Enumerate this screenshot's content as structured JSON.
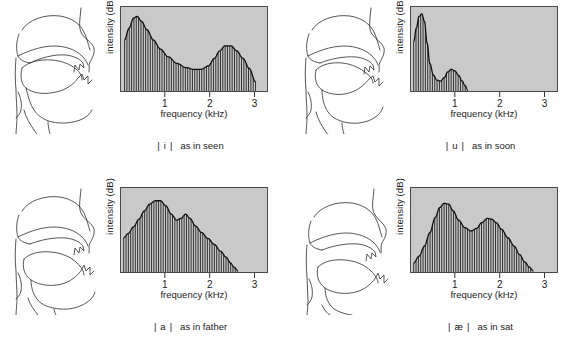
{
  "figure": {
    "plot_bg_color": "#c9c9c9",
    "line_color": "#1a1a1a"
  },
  "axes": {
    "ylabel": "intensity (dB)",
    "xlabel": "frequency (kHz)",
    "xticks": [
      "1",
      "2",
      "3"
    ]
  },
  "chart_data": [
    {
      "type": "line",
      "title": "| i |  as in seen",
      "xlabel": "frequency (kHz)",
      "ylabel": "intensity (dB)",
      "xlim": [
        0,
        3.3
      ],
      "ylim": [
        0,
        1
      ],
      "xticks": [
        1,
        2,
        3
      ],
      "grid": false,
      "legend": null,
      "harmonics": true,
      "envelope": {
        "x": [
          0.08,
          0.18,
          0.28,
          0.36,
          0.46,
          0.58,
          0.72,
          0.88,
          1.05,
          1.25,
          1.45,
          1.62,
          1.78,
          1.95,
          2.08,
          2.2,
          2.32,
          2.45,
          2.58,
          2.72,
          2.86,
          3.0
        ],
        "y": [
          0.62,
          0.76,
          0.88,
          0.9,
          0.84,
          0.74,
          0.62,
          0.51,
          0.42,
          0.34,
          0.29,
          0.27,
          0.27,
          0.31,
          0.4,
          0.49,
          0.55,
          0.55,
          0.49,
          0.4,
          0.28,
          0.12
        ]
      }
    },
    {
      "type": "line",
      "title": "| u |  as in soon",
      "xlabel": "frequency (kHz)",
      "ylabel": "intensity (dB)",
      "xlim": [
        0,
        3.3
      ],
      "ylim": [
        0,
        1
      ],
      "xticks": [
        1,
        2,
        3
      ],
      "grid": false,
      "legend": null,
      "harmonics": true,
      "envelope": {
        "x": [
          0.06,
          0.12,
          0.18,
          0.24,
          0.3,
          0.36,
          0.42,
          0.5,
          0.58,
          0.66,
          0.74,
          0.82,
          0.9,
          0.98,
          1.06,
          1.14,
          1.2,
          1.26
        ],
        "y": [
          0.6,
          0.76,
          0.9,
          0.93,
          0.84,
          0.58,
          0.34,
          0.2,
          0.14,
          0.13,
          0.17,
          0.24,
          0.27,
          0.25,
          0.2,
          0.13,
          0.08,
          0.03
        ]
      }
    },
    {
      "type": "line",
      "title": "| a |  as in father",
      "xlabel": "frequency (kHz)",
      "ylabel": "intensity (dB)",
      "xlim": [
        0,
        3.3
      ],
      "ylim": [
        0,
        1
      ],
      "xticks": [
        1,
        2,
        3
      ],
      "grid": false,
      "legend": null,
      "harmonics": true,
      "envelope": {
        "x": [
          0.06,
          0.16,
          0.28,
          0.4,
          0.52,
          0.64,
          0.76,
          0.88,
          1.0,
          1.12,
          1.24,
          1.34,
          1.44,
          1.54,
          1.66,
          1.8,
          1.94,
          2.08,
          2.22,
          2.34,
          2.44,
          2.52,
          2.6
        ],
        "y": [
          0.42,
          0.47,
          0.55,
          0.64,
          0.74,
          0.82,
          0.86,
          0.86,
          0.8,
          0.7,
          0.63,
          0.65,
          0.7,
          0.65,
          0.56,
          0.48,
          0.41,
          0.34,
          0.26,
          0.19,
          0.12,
          0.07,
          0.03
        ]
      }
    },
    {
      "type": "line",
      "title": "| æ |  as in sat",
      "xlabel": "frequency (kHz)",
      "ylabel": "intensity (dB)",
      "xlim": [
        0,
        3.3
      ],
      "ylim": [
        0,
        1
      ],
      "xticks": [
        1,
        2,
        3
      ],
      "grid": false,
      "legend": null,
      "harmonics": true,
      "envelope": {
        "x": [
          0.06,
          0.18,
          0.3,
          0.42,
          0.54,
          0.64,
          0.74,
          0.84,
          0.94,
          1.06,
          1.2,
          1.34,
          1.46,
          1.58,
          1.7,
          1.8,
          1.9,
          2.02,
          2.16,
          2.3,
          2.42,
          2.54,
          2.64,
          2.72
        ],
        "y": [
          0.12,
          0.2,
          0.32,
          0.48,
          0.66,
          0.78,
          0.83,
          0.82,
          0.74,
          0.63,
          0.54,
          0.5,
          0.53,
          0.6,
          0.65,
          0.64,
          0.6,
          0.52,
          0.42,
          0.32,
          0.22,
          0.13,
          0.07,
          0.03
        ]
      }
    }
  ],
  "panels": [
    {
      "id": "vowel-i",
      "symbol": "i",
      "bar": "|",
      "description": "as in seen",
      "tract_name": "vocal-tract-diagram-i"
    },
    {
      "id": "vowel-u",
      "symbol": "u",
      "bar": "|",
      "description": "as in soon",
      "tract_name": "vocal-tract-diagram-u"
    },
    {
      "id": "vowel-a",
      "symbol": "a",
      "bar": "|",
      "description": "as in father",
      "tract_name": "vocal-tract-diagram-a"
    },
    {
      "id": "vowel-ae",
      "symbol": "æ",
      "bar": "|",
      "description": "as in sat",
      "tract_name": "vocal-tract-diagram-ae"
    }
  ]
}
